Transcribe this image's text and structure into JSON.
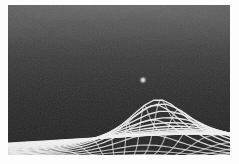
{
  "figure": {
    "width_px": 239,
    "height_px": 164,
    "background_color": "#fbfbfb"
  },
  "canvas": {
    "offset_x_px": 8,
    "offset_y_px": 5,
    "width_px": 222,
    "height_px": 150,
    "surface_color": "#2a2a2a"
  },
  "style": {
    "grid_line_color": "#f2f2f2",
    "grid_line_color_dim": "#8d8d8d",
    "cell_fill_dark": "#242424",
    "cell_fill_mid": "#3a3a3a",
    "highlight_color": "#ffffff",
    "haze_color": "#808080",
    "vignette_color": "#000000"
  },
  "chart_data": {
    "type": "heatmap",
    "subtitle": "",
    "xlabel": "",
    "ylabel": "",
    "grid": true,
    "legend": "none",
    "projection": {
      "type": "perspective",
      "camera_height": 0.38,
      "camera_tilt_deg": 62,
      "horizon_y_px": 0,
      "vanishing_x_px": 111
    },
    "mesh": {
      "u_lines": 34,
      "v_lines": 26,
      "u_range": [
        -6.0,
        6.0
      ],
      "v_range": [
        0.55,
        9.5
      ],
      "line_width_near_px": 1.5,
      "line_width_far_px": 0.55
    },
    "well": {
      "label": "central mass",
      "center_u": 0.85,
      "center_v": 2.55,
      "screen_x_px": 135,
      "screen_y_px": 75,
      "depth_amplitude": 1.35,
      "radius": 1.35,
      "profile": "inverse-square-softened",
      "bright_point": true,
      "bright_point_radius_px": 3
    },
    "shading": {
      "haze_top_opacity": 0.55,
      "haze_fade_stop": 0.66,
      "vignette_opacity": 0.3,
      "grain_opacity": 0.16
    }
  }
}
